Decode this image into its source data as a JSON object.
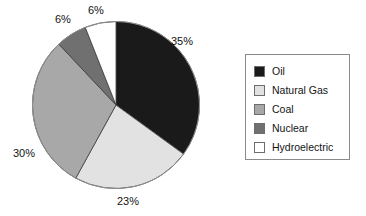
{
  "chart_data": {
    "type": "pie",
    "title": "",
    "labels": [
      "Oil",
      "Natural Gas",
      "Coal",
      "Nuclear",
      "Hydroelectric"
    ],
    "values": [
      35,
      23,
      30,
      6,
      6
    ],
    "value_labels": [
      "35%",
      "23%",
      "30%",
      "6%",
      "6%"
    ],
    "unit": "%",
    "start_angle_deg": 0,
    "direction": "clockwise",
    "legend_position": "right",
    "grid": false,
    "colors": [
      "#1a1a1a",
      "#e2e2e2",
      "#a8a8a8",
      "#707070",
      "#ffffff"
    ],
    "slices": [
      {
        "label": "Oil",
        "value": 35,
        "value_label": "35%",
        "color": "#1a1a1a"
      },
      {
        "label": "Natural Gas",
        "value": 23,
        "value_label": "23%",
        "color": "#e2e2e2"
      },
      {
        "label": "Coal",
        "value": 30,
        "value_label": "30%",
        "color": "#a8a8a8"
      },
      {
        "label": "Nuclear",
        "value": 6,
        "value_label": "6%",
        "color": "#707070"
      },
      {
        "label": "Hydroelectric",
        "value": 6,
        "value_label": "6%",
        "color": "#ffffff"
      }
    ]
  },
  "legend": {
    "items": [
      {
        "label": "Oil",
        "color": "#1a1a1a"
      },
      {
        "label": "Natural Gas",
        "color": "#e2e2e2"
      },
      {
        "label": "Coal",
        "color": "#a8a8a8"
      },
      {
        "label": "Nuclear",
        "color": "#707070"
      },
      {
        "label": "Hydroelectric",
        "color": "#ffffff"
      }
    ]
  }
}
